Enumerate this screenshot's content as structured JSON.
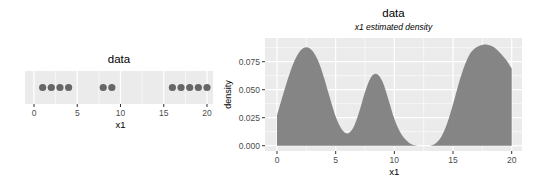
{
  "chart_data": [
    {
      "type": "scatter",
      "title": "data",
      "xlabel": "x1",
      "ylabel": "",
      "xlim": [
        -1,
        21
      ],
      "x_ticks": [
        0,
        5,
        10,
        15,
        20
      ],
      "x_tick_labels": [
        "0",
        "5",
        "10",
        "15",
        "20"
      ],
      "grid": true,
      "points": [
        1,
        2,
        3,
        4,
        8,
        9,
        16,
        17,
        18,
        19,
        20
      ],
      "point_color": "#666666"
    },
    {
      "type": "area",
      "title": "data",
      "subtitle": "x1 estimated density",
      "xlabel": "x1",
      "ylabel": "density",
      "xlim": [
        -0.8,
        20.7
      ],
      "ylim": [
        -0.004,
        0.094
      ],
      "x_ticks": [
        0,
        5,
        10,
        15,
        20
      ],
      "x_tick_labels": [
        "0",
        "5",
        "10",
        "15",
        "20"
      ],
      "y_ticks": [
        0.0,
        0.025,
        0.05,
        0.075
      ],
      "y_tick_labels": [
        "0.000",
        "0.025",
        "0.050",
        "0.075"
      ],
      "grid": true,
      "fill_color": "#808080",
      "x": [
        0,
        0.5,
        1,
        1.5,
        2,
        2.5,
        3,
        3.5,
        4,
        4.5,
        5,
        5.5,
        6,
        6.5,
        7,
        7.5,
        8,
        8.5,
        9,
        9.5,
        10,
        10.5,
        11,
        11.5,
        12,
        12.5,
        13,
        13.5,
        14,
        14.5,
        15,
        15.5,
        16,
        16.5,
        17,
        17.5,
        18,
        18.5,
        19,
        19.5,
        20
      ],
      "y": [
        0.027,
        0.045,
        0.062,
        0.076,
        0.085,
        0.088,
        0.085,
        0.076,
        0.061,
        0.043,
        0.026,
        0.015,
        0.011,
        0.016,
        0.03,
        0.048,
        0.061,
        0.064,
        0.057,
        0.041,
        0.024,
        0.012,
        0.005,
        0.001,
        0.0,
        0.0,
        0.0,
        0.002,
        0.008,
        0.02,
        0.037,
        0.056,
        0.072,
        0.083,
        0.088,
        0.09,
        0.09,
        0.088,
        0.083,
        0.077,
        0.069
      ]
    }
  ]
}
